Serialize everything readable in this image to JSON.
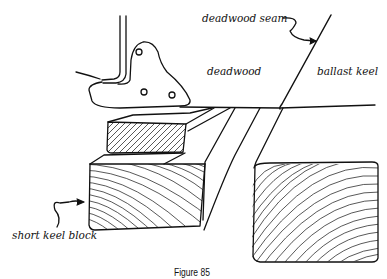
{
  "figure": {
    "caption": "Figure 85",
    "labels": {
      "deadwood_seam": "deadwood seam",
      "deadwood": "deadwood",
      "ballast_keel": "ballast keel",
      "short_keel_block": "short keel block"
    }
  },
  "colors": {
    "ink": "#111111",
    "background": "#ffffff"
  }
}
